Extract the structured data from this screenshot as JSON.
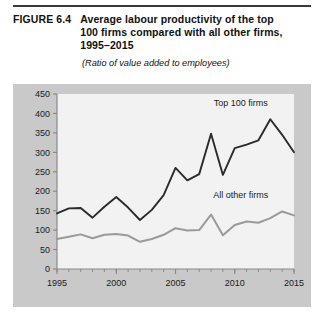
{
  "figure": {
    "number": "FIGURE 6.4",
    "title": "Average labour productivity of the top 100 firms compared with all other firms, 1995–2015",
    "subtitle": "(Ratio of value added to employees)"
  },
  "colors": {
    "panel_background": "#c9c9c9",
    "plot_background": "#f2f2f2",
    "axis": "#8a8a8a",
    "top_rule": "#3a3a3a",
    "series_top100": "#2b2b2b",
    "series_all_other": "#9a9a9a",
    "text": "#1a1a1a"
  },
  "chart_data": {
    "type": "line",
    "title": "Average labour productivity of the top 100 firms compared with all other firms, 1995–2015",
    "subtitle": "(Ratio of value added to employees)",
    "xlabel": "",
    "ylabel": "",
    "xlim": [
      1995,
      2015
    ],
    "ylim": [
      0,
      450
    ],
    "ytick_step": 50,
    "grid": false,
    "legend_position": "inline-annotation",
    "x_major_ticks": [
      1995,
      2000,
      2005,
      2010,
      2015
    ],
    "x_minor_tick_interval": 1,
    "xtick_labels": [
      "1995",
      "2000",
      "2005",
      "2010",
      "2015"
    ],
    "ytick_labels": [
      "0",
      "50",
      "100",
      "150",
      "200",
      "250",
      "300",
      "350",
      "400",
      "450"
    ],
    "x": [
      1995,
      1996,
      1997,
      1998,
      1999,
      2000,
      2001,
      2002,
      2003,
      2004,
      2005,
      2006,
      2007,
      2008,
      2009,
      2010,
      2011,
      2012,
      2013,
      2014,
      2015
    ],
    "series": [
      {
        "name": "Top 100 firms",
        "color": "#2b2b2b",
        "values": [
          143,
          156,
          157,
          132,
          160,
          185,
          158,
          126,
          152,
          190,
          260,
          228,
          244,
          348,
          242,
          311,
          320,
          331,
          385,
          345,
          300
        ]
      },
      {
        "name": "All other firms",
        "color": "#9a9a9a",
        "values": [
          77,
          83,
          89,
          79,
          88,
          90,
          86,
          70,
          77,
          88,
          105,
          99,
          100,
          140,
          87,
          113,
          122,
          119,
          131,
          148,
          138
        ]
      }
    ],
    "annotations": [
      {
        "text": "Top 100 firms",
        "x": 2010.5,
        "y": 420
      },
      {
        "text": "All other firms",
        "x": 2010.5,
        "y": 183
      }
    ]
  }
}
